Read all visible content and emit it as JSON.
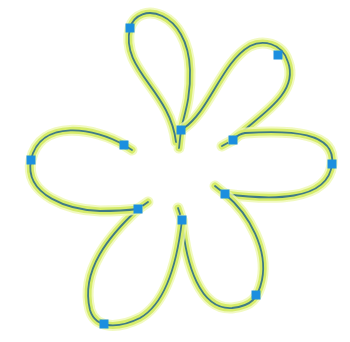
{
  "diagram": {
    "type": "flower-bezier-curves",
    "colors": {
      "background": "#ffffff",
      "glow": "#d6ec6a",
      "glow_outer": "#eef7b0",
      "core": "#3f7a86",
      "marker": "#1c8fdf"
    },
    "stroke": {
      "glow_width": 7,
      "glow_outer_width": 11,
      "core_width": 1.8
    },
    "marker_size": 9,
    "petals": [
      {
        "name": "top",
        "path": "M 176 142 C 170 90, 120 70, 130 28 C 138 0, 188 10, 190 70 C 191 100, 183 118, 181 130 L 179 148",
        "inner_marker": [
          181,
          130
        ],
        "outer_marker": [
          130,
          28
        ]
      },
      {
        "name": "upper-right",
        "path": "M 222 146 L 233 140 C 255 118, 300 95, 288 62 C 282 42, 262 40, 250 46 C 222 62, 210 110, 184 128",
        "inner_marker": [
          233,
          140
        ],
        "outer_marker": [
          278,
          55
        ]
      },
      {
        "name": "right",
        "path": "M 215 186 L 225 194 C 270 200, 328 202, 332 164 C 336 132, 290 130, 245 133 C 238 134, 236 137, 233 140",
        "inner_marker": [
          225,
          194
        ],
        "outer_marker": [
          332,
          164
        ]
      },
      {
        "name": "bottom-right",
        "path": "M 178 208 L 182 220 C 186 265, 200 310, 232 308 C 252 306, 258 298, 262 280 C 268 250, 250 215, 225 194",
        "inner_marker": [
          182,
          220
        ],
        "outer_marker": [
          256,
          295
        ]
      },
      {
        "name": "bottom-left",
        "path": "M 148 202 L 138 209 C 110 235, 80 270, 90 310 C 96 330, 120 328, 140 318 C 168 302, 178 255, 182 220",
        "inner_marker": [
          138,
          209
        ],
        "outer_marker": [
          104,
          324
        ]
      },
      {
        "name": "left",
        "path": "M 132 150 L 124 145 C 96 128, 40 118, 31 160 C 24 196, 70 210, 100 211 C 118 211, 130 210, 138 209",
        "inner_marker": [
          124,
          145
        ],
        "outer_marker": [
          31,
          160
        ]
      }
    ]
  }
}
